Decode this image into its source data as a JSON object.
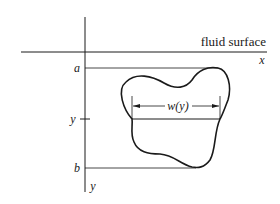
{
  "diagram": {
    "surface_label": "fluid surface",
    "x_axis_label": "x",
    "y_axis_label": "y",
    "top_label": "a",
    "bottom_label": "b",
    "level_label": "y",
    "width_label": "w(y)",
    "colors": {
      "ink": "#1a1a1a",
      "background": "#ffffff"
    }
  }
}
